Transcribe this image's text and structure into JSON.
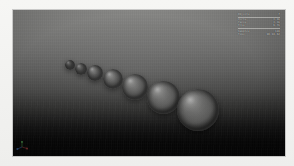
{
  "app": {
    "title": "3D Render Viewport",
    "view_label": "Perspective"
  },
  "viewport": {
    "background_top_color": "#8a8a88",
    "background_bottom_color": "#050505",
    "shading": "rendered"
  },
  "stats_overlay": {
    "rows": [
      {
        "label": "Objects",
        "value": "7"
      },
      {
        "label": "Verts",
        "value": "3.4k"
      },
      {
        "label": "Faces",
        "value": "3.3k"
      },
      {
        "label": "Tris",
        "value": "6.7k"
      },
      {
        "label": "Samples",
        "value": "128"
      },
      {
        "label": "Time",
        "value": "00:04.62"
      }
    ]
  },
  "scene": {
    "description": "Seven shaded spheres of increasing radius arranged along a diagonal on a dark ground plane",
    "sphere_material_color": "#5d5d5c",
    "spheres": [
      {
        "name": "sphere-1",
        "cx": 57,
        "cy": 55,
        "r": 5.0
      },
      {
        "name": "sphere-2",
        "cx": 68,
        "cy": 59,
        "r": 6.4
      },
      {
        "name": "sphere-3",
        "cx": 82,
        "cy": 63,
        "r": 8.1
      },
      {
        "name": "sphere-4",
        "cx": 100,
        "cy": 69,
        "r": 10.3
      },
      {
        "name": "sphere-5",
        "cx": 122,
        "cy": 77,
        "r": 13.0
      },
      {
        "name": "sphere-6",
        "cx": 150,
        "cy": 87,
        "r": 16.5
      },
      {
        "name": "sphere-7",
        "cx": 185,
        "cy": 100,
        "r": 21.0
      }
    ]
  },
  "axis_gizmo": {
    "x_label": "X",
    "y_label": "Y",
    "z_label": "Z",
    "x_color": "#cc4b4b",
    "y_color": "#5fbf5f",
    "z_color": "#4b7fcc"
  }
}
